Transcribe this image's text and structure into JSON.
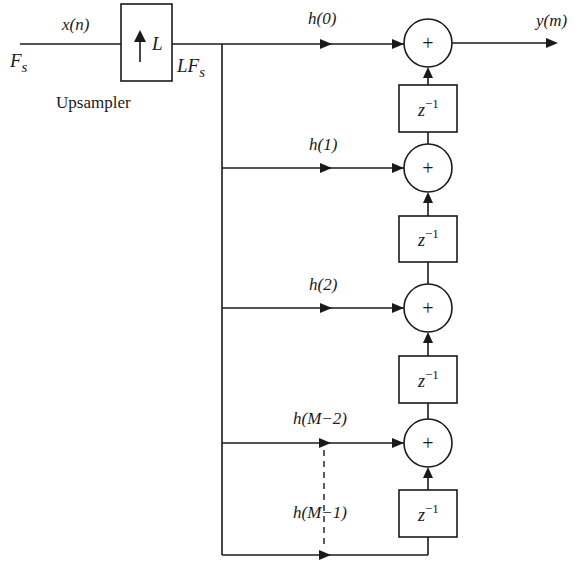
{
  "diagram": {
    "input": {
      "signal_label": "x(n)",
      "rate_label_main": "F",
      "rate_label_sub": "s"
    },
    "upsampler": {
      "symbol": "↑",
      "factor": "L",
      "caption": "Upsampler"
    },
    "upsampled_rate": {
      "main": "LF",
      "sub": "s"
    },
    "output": {
      "signal_label": "y(m)"
    },
    "taps": [
      {
        "label": "h(0)"
      },
      {
        "label": "h(1)"
      },
      {
        "label": "h(2)"
      },
      {
        "label": "h(M−2)"
      },
      {
        "label": "h(M−1)"
      }
    ],
    "adders": [
      {
        "symbol": "+"
      },
      {
        "symbol": "+"
      },
      {
        "symbol": "+"
      },
      {
        "symbol": "+"
      }
    ],
    "delays": [
      {
        "base": "z",
        "exp": "−1"
      },
      {
        "base": "z",
        "exp": "−1"
      },
      {
        "base": "z",
        "exp": "−1"
      },
      {
        "base": "z",
        "exp": "−1"
      }
    ],
    "colors": {
      "ink": "#1a1a1a",
      "background": "#ffffff"
    }
  }
}
